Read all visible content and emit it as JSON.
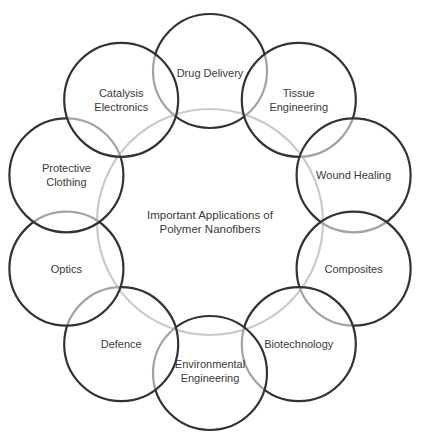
{
  "center": {
    "label_lines": [
      "Important Applications of",
      "Polymer Nanofibers"
    ],
    "cx": 210,
    "cy": 222,
    "r": 113,
    "stroke": "#8a8a8a"
  },
  "ring": {
    "radius": 151,
    "circle_radius": 57,
    "stroke": "#333333"
  },
  "applications": [
    {
      "label_lines": [
        "Drug Delivery"
      ],
      "angle": -90,
      "label_dy": 0.2
    },
    {
      "label_lines": [
        "Tissue",
        "Engineering"
      ],
      "angle": -54,
      "label_dy": 0
    },
    {
      "label_lines": [
        "Wound Healing"
      ],
      "angle": -18,
      "label_dy": 0
    },
    {
      "label_lines": [
        "Composites"
      ],
      "angle": 18,
      "label_dy": 0
    },
    {
      "label_lines": [
        "Biotechnology"
      ],
      "angle": 54,
      "label_dy": 0
    },
    {
      "label_lines": [
        "Environmental",
        "Engineering"
      ],
      "angle": 90,
      "label_dy": -0.2
    },
    {
      "label_lines": [
        "Defence"
      ],
      "angle": 126,
      "label_dy": 0
    },
    {
      "label_lines": [
        "Optics"
      ],
      "angle": 162,
      "label_dy": 0
    },
    {
      "label_lines": [
        "Protective",
        "Clothing"
      ],
      "angle": 198,
      "label_dy": 0
    },
    {
      "label_lines": [
        "Catalysis",
        "Electronics"
      ],
      "angle": 234,
      "label_dy": 0
    }
  ]
}
